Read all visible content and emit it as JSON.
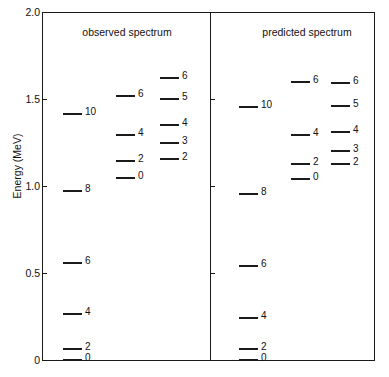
{
  "figure": {
    "ylabel": "Energy (MeV)",
    "axis": {
      "ticks": [
        {
          "label": "2.0",
          "value": 2.0
        },
        {
          "label": "1.5",
          "value": 1.5
        },
        {
          "label": "1.0",
          "value": 1.0
        },
        {
          "label": "0.5",
          "value": 0.5
        },
        {
          "label": "0",
          "value": 0.0
        }
      ]
    },
    "panels": [
      {
        "title": "observed spectrum"
      },
      {
        "title": "predicted spectrum"
      }
    ]
  },
  "chart_data": {
    "type": "scatter",
    "title": "",
    "subtitle": "",
    "xlabel": "",
    "ylabel": "Energy (MeV)",
    "ylim": [
      0.0,
      2.0
    ],
    "xlim": [
      0,
      1
    ],
    "grid": false,
    "legend_position": "none",
    "axis_tick_labels": [
      "2.0",
      "1.5",
      "1.0",
      "0.5",
      "0"
    ],
    "annotations": [
      "observed spectrum",
      "predicted spectrum"
    ],
    "series": [
      {
        "name": "observed spectrum / band 1",
        "panel": "observed",
        "band": 1,
        "labels": [
          "0",
          "2",
          "4",
          "6",
          "8",
          "10"
        ],
        "values": [
          0.0,
          0.069,
          0.27,
          0.563,
          0.977,
          1.42
        ]
      },
      {
        "name": "observed spectrum / band 2",
        "panel": "observed",
        "band": 2,
        "labels": [
          "0",
          "2",
          "4",
          "6"
        ],
        "values": [
          1.052,
          1.149,
          1.299,
          1.523
        ]
      },
      {
        "name": "observed spectrum / band 3",
        "panel": "observed",
        "band": 3,
        "labels": [
          "2",
          "3",
          "4",
          "5",
          "6"
        ],
        "values": [
          1.161,
          1.253,
          1.356,
          1.506,
          1.626
        ]
      },
      {
        "name": "predicted spectrum / band 1",
        "panel": "predicted",
        "band": 1,
        "labels": [
          "0",
          "2",
          "4",
          "6",
          "8",
          "10"
        ],
        "values": [
          0.006,
          0.069,
          0.247,
          0.546,
          0.96,
          1.46
        ]
      },
      {
        "name": "predicted spectrum / band 2",
        "panel": "predicted",
        "band": 2,
        "labels": [
          "0",
          "2",
          "4",
          "6"
        ],
        "values": [
          1.046,
          1.132,
          1.299,
          1.603
        ]
      },
      {
        "name": "predicted spectrum / band 3",
        "panel": "predicted",
        "band": 3,
        "labels": [
          "2",
          "3",
          "4",
          "5",
          "6"
        ],
        "values": [
          1.132,
          1.207,
          1.316,
          1.466,
          1.598
        ]
      }
    ]
  },
  "levels": {
    "observed": [
      {
        "label": "10",
        "y": 113,
        "x": 63,
        "w": 19,
        "lx": 85
      },
      {
        "label": "8",
        "y": 190,
        "x": 63,
        "w": 19,
        "lx": 85
      },
      {
        "label": "6",
        "y": 262,
        "x": 63,
        "w": 19,
        "lx": 85
      },
      {
        "label": "4",
        "y": 313,
        "x": 63,
        "w": 19,
        "lx": 85
      },
      {
        "label": "2",
        "y": 348,
        "x": 63,
        "w": 19,
        "lx": 85
      },
      {
        "label": "0",
        "y": 359,
        "x": 63,
        "w": 19,
        "lx": 85
      },
      {
        "label": "6",
        "y": 95,
        "x": 116,
        "w": 19,
        "lx": 138
      },
      {
        "label": "4",
        "y": 134,
        "x": 116,
        "w": 19,
        "lx": 138
      },
      {
        "label": "2",
        "y": 160,
        "x": 116,
        "w": 19,
        "lx": 138
      },
      {
        "label": "0",
        "y": 177,
        "x": 116,
        "w": 19,
        "lx": 138
      },
      {
        "label": "6",
        "y": 77,
        "x": 160,
        "w": 19,
        "lx": 182
      },
      {
        "label": "5",
        "y": 98,
        "x": 160,
        "w": 19,
        "lx": 182
      },
      {
        "label": "4",
        "y": 124,
        "x": 160,
        "w": 19,
        "lx": 182
      },
      {
        "label": "3",
        "y": 142,
        "x": 160,
        "w": 19,
        "lx": 182
      },
      {
        "label": "2",
        "y": 158,
        "x": 160,
        "w": 19,
        "lx": 182
      }
    ],
    "predicted": [
      {
        "label": "10",
        "y": 106,
        "x": 239,
        "w": 19,
        "lx": 261
      },
      {
        "label": "8",
        "y": 193,
        "x": 239,
        "w": 19,
        "lx": 261
      },
      {
        "label": "6",
        "y": 265,
        "x": 239,
        "w": 19,
        "lx": 261
      },
      {
        "label": "4",
        "y": 317,
        "x": 239,
        "w": 19,
        "lx": 261
      },
      {
        "label": "2",
        "y": 348,
        "x": 239,
        "w": 19,
        "lx": 261
      },
      {
        "label": "0",
        "y": 359,
        "x": 239,
        "w": 19,
        "lx": 261
      },
      {
        "label": "6",
        "y": 81,
        "x": 291,
        "w": 19,
        "lx": 313
      },
      {
        "label": "4",
        "y": 134,
        "x": 291,
        "w": 19,
        "lx": 313
      },
      {
        "label": "2",
        "y": 163,
        "x": 291,
        "w": 19,
        "lx": 313
      },
      {
        "label": "0",
        "y": 178,
        "x": 291,
        "w": 19,
        "lx": 313
      },
      {
        "label": "6",
        "y": 82,
        "x": 331,
        "w": 19,
        "lx": 353
      },
      {
        "label": "5",
        "y": 105,
        "x": 331,
        "w": 19,
        "lx": 353
      },
      {
        "label": "4",
        "y": 131,
        "x": 331,
        "w": 19,
        "lx": 353
      },
      {
        "label": "3",
        "y": 150,
        "x": 331,
        "w": 19,
        "lx": 353
      },
      {
        "label": "2",
        "y": 163,
        "x": 331,
        "w": 19,
        "lx": 353
      }
    ]
  },
  "geometry": {
    "tick_y": [
      12,
      99,
      186,
      273,
      360
    ],
    "panel_title_y": 26,
    "panel_title_x": [
      62,
      242
    ],
    "panel_title_w": [
      130,
      130
    ]
  },
  "colors": {
    "ink": "#1a1a1a",
    "background": "#ffffff"
  }
}
